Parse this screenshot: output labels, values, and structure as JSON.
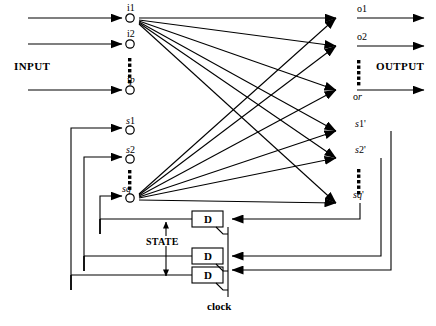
{
  "diagram": {
    "labels": {
      "input": "INPUT",
      "output": "OUTPUT",
      "state": "STATE",
      "clock": "clock",
      "dff": "D"
    },
    "colors": {
      "line": "#000000",
      "background": "#ffffff",
      "node_fill": "#ffffff"
    },
    "input_nodes": [
      {
        "id": "i1",
        "main": "i",
        "sub": "1",
        "x": 130,
        "y": 18
      },
      {
        "id": "i2",
        "main": "i",
        "sub": "2",
        "x": 130,
        "y": 44
      },
      {
        "id": "ip",
        "main": "i",
        "sub": "p",
        "x": 130,
        "y": 90
      }
    ],
    "state_nodes": [
      {
        "id": "s1",
        "main": "s",
        "sub": "1",
        "x": 130,
        "y": 130
      },
      {
        "id": "s2",
        "main": "s",
        "sub": "2",
        "x": 130,
        "y": 159
      },
      {
        "id": "sq",
        "main": "s",
        "sub": "q",
        "x": 130,
        "y": 198
      }
    ],
    "output_nodes": [
      {
        "id": "o1",
        "main": "o",
        "sub": "1",
        "x": 355,
        "y": 18
      },
      {
        "id": "o2",
        "main": "o",
        "sub": "2",
        "x": 355,
        "y": 46
      },
      {
        "id": "or",
        "main": "o",
        "sub": "r",
        "x": 355,
        "y": 90
      }
    ],
    "next_state_nodes": [
      {
        "id": "s1p",
        "main": "s",
        "sub": "1",
        "prime": "'",
        "x": 355,
        "y": 131
      },
      {
        "id": "s2p",
        "main": "s",
        "sub": "2",
        "prime": "'",
        "x": 355,
        "y": 158
      },
      {
        "id": "sqp",
        "main": "s",
        "sub": "q",
        "prime": "'",
        "x": 355,
        "y": 203
      }
    ],
    "flipflops": [
      {
        "id": "d1",
        "label": "D",
        "x": 192,
        "y": 211,
        "w": 31,
        "h": 16
      },
      {
        "id": "d2",
        "label": "D",
        "x": 192,
        "y": 248,
        "w": 31,
        "h": 16
      },
      {
        "id": "d3",
        "label": "D",
        "x": 192,
        "y": 267,
        "w": 31,
        "h": 16
      }
    ],
    "vertical_ellipsis": [
      {
        "id": "input-ellipsis",
        "x": 130,
        "y_top": 58,
        "y_bottom": 80,
        "dots": 6
      },
      {
        "id": "state-ellipsis",
        "x": 130,
        "y_top": 170,
        "y_bottom": 188,
        "dots": 5
      },
      {
        "id": "output-ellipsis",
        "x": 358,
        "y_top": 60,
        "y_bottom": 82,
        "dots": 6
      },
      {
        "id": "nextstate-ellipsis",
        "x": 358,
        "y_top": 169,
        "y_bottom": 192,
        "dots": 6
      }
    ],
    "annotations": {
      "input_label_pos": {
        "x": 14,
        "y": 66
      },
      "output_label_pos": {
        "x": 378,
        "y": 66
      },
      "state_label_pos": {
        "x": 148,
        "y": 238
      },
      "clock_label_pos": {
        "x": 208,
        "y": 303
      }
    }
  }
}
